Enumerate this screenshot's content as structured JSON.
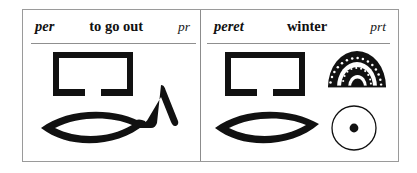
{
  "page": {
    "background_color": "#ffffff",
    "ink_color": "#111111",
    "border_color": "#9a9a9a"
  },
  "table": {
    "columns": 2,
    "entries": [
      {
        "id": "entry-per",
        "transliteration": "per",
        "meaning": "to go out",
        "code": "pr",
        "glyphs": [
          {
            "name": "house-hieroglyph",
            "sign": "pr"
          },
          {
            "name": "mouth-hieroglyph",
            "sign": "r"
          },
          {
            "name": "walking-legs-hieroglyph",
            "sign": "determinative"
          }
        ]
      },
      {
        "id": "entry-peret",
        "transliteration": "peret",
        "meaning": "winter",
        "code": "prt",
        "glyphs": [
          {
            "name": "house-hieroglyph",
            "sign": "pr"
          },
          {
            "name": "bread-loaf-hieroglyph",
            "sign": "t"
          },
          {
            "name": "mouth-hieroglyph",
            "sign": "r"
          },
          {
            "name": "sun-disc-hieroglyph",
            "sign": "determinative"
          }
        ]
      }
    ]
  }
}
